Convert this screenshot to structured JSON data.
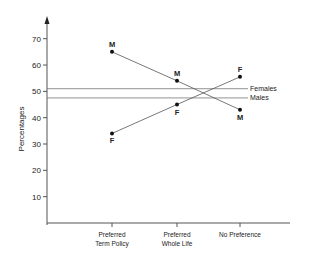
{
  "chart_data": {
    "type": "line",
    "title": "",
    "xlabel": "",
    "ylabel": "Percentages",
    "ylim": [
      0,
      75
    ],
    "yticks": [
      10,
      20,
      30,
      40,
      50,
      60,
      70
    ],
    "categories": [
      "Preferred Term Policy",
      "Preferred Whole Life",
      "No Preference"
    ],
    "category_lines": [
      [
        "Preferred",
        "Term Policy"
      ],
      [
        "Preferred",
        "Whole Life"
      ],
      [
        "No Preference"
      ]
    ],
    "series": [
      {
        "name": "M",
        "marker_label": "M",
        "values": [
          65,
          54,
          43
        ]
      },
      {
        "name": "F",
        "marker_label": "F",
        "values": [
          34,
          45,
          55.5
        ]
      }
    ],
    "reference_lines": [
      {
        "name": "Females",
        "value": 51
      },
      {
        "name": "Males",
        "value": 47.5
      }
    ],
    "grid": false,
    "legend": "reference line labels at right"
  },
  "colors": {
    "line": "#555555",
    "text": "#222222",
    "point": "#111111"
  }
}
